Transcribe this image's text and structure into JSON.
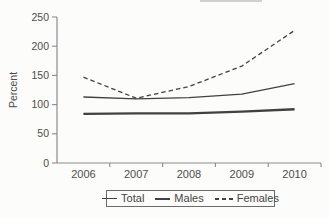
{
  "chart_data": {
    "type": "line",
    "title": "",
    "xlabel": "",
    "ylabel": "Percent",
    "categories": [
      "2006",
      "2007",
      "2008",
      "2009",
      "2010"
    ],
    "yticks": [
      0,
      50,
      100,
      150,
      200,
      250
    ],
    "ylim": [
      0,
      250
    ],
    "grid": false,
    "legend_position": "bottom",
    "series": [
      {
        "name": "Total",
        "style": "solid-thin",
        "values": [
          113,
          110,
          112,
          118,
          136
        ]
      },
      {
        "name": "Males",
        "style": "solid-thick",
        "values": [
          84,
          85,
          85,
          88,
          92
        ]
      },
      {
        "name": "Females",
        "style": "dashed",
        "values": [
          147,
          111,
          131,
          166,
          227
        ]
      }
    ]
  },
  "colors": {
    "line": "#414141",
    "axis": "#8c8c8c",
    "text": "#4d4d4d",
    "background": "#fcfcfb"
  }
}
